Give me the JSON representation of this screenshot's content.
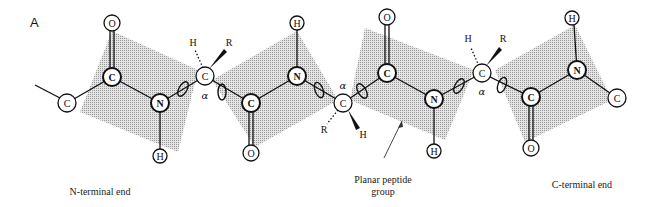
{
  "figure": {
    "panel_label": "A",
    "captions": {
      "n_terminal": "N-terminal end",
      "c_terminal": "C-terminal end",
      "planar_line1": "Planar peptide",
      "planar_line2": "group"
    },
    "alpha_symbol": "α",
    "atoms": {
      "c_left": "C",
      "o1": "O",
      "c1": "C",
      "n1": "N",
      "h1": "H",
      "ca1": "C",
      "ca1_h": "H",
      "ca1_r": "R",
      "c2": "C",
      "o2": "O",
      "n2": "N",
      "h2": "H",
      "ca2": "C",
      "ca2_r": "R",
      "ca2_h": "H",
      "o3": "O",
      "c3": "C",
      "n3": "N",
      "h3": "H",
      "ca3": "C",
      "ca3_h": "H",
      "ca3_r": "R",
      "c4": "C",
      "o4": "O",
      "n4": "N",
      "h4": "H",
      "c_right": "C"
    }
  }
}
